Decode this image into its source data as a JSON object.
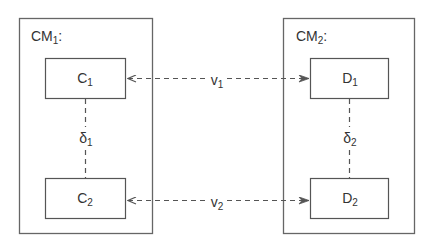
{
  "diagram": {
    "models": [
      {
        "id": "cm1",
        "name": "CM",
        "subscript": "1",
        "suffix": ":"
      },
      {
        "id": "cm2",
        "name": "CM",
        "subscript": "2",
        "suffix": ":"
      }
    ],
    "nodes": [
      {
        "id": "c1",
        "name": "C",
        "subscript": "1"
      },
      {
        "id": "c2",
        "name": "C",
        "subscript": "2"
      },
      {
        "id": "d1",
        "name": "D",
        "subscript": "1"
      },
      {
        "id": "d2",
        "name": "D",
        "subscript": "2"
      }
    ],
    "edges": [
      {
        "id": "v1",
        "name": "v",
        "subscript": "1",
        "from": "c1",
        "to": "d1",
        "style": "dashed-arrow"
      },
      {
        "id": "v2",
        "name": "v",
        "subscript": "2",
        "from": "c2",
        "to": "d2",
        "style": "dashed-arrow"
      },
      {
        "id": "delta1",
        "name": "δ",
        "subscript": "1",
        "from": "c1",
        "to": "c2",
        "style": "dashed-line"
      },
      {
        "id": "delta2",
        "name": "δ",
        "subscript": "2",
        "from": "d1",
        "to": "d2",
        "style": "dashed-line"
      }
    ],
    "colors": {
      "stroke": "#555555",
      "text": "#333333",
      "background": "#ffffff"
    }
  }
}
